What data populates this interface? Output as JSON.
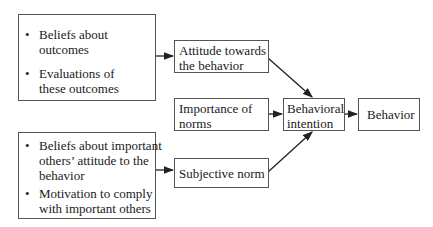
{
  "diagram": {
    "bullet_glyph": "•",
    "outcomes_box": {
      "items": [
        {
          "line1": "Beliefs about",
          "line2": "outcomes"
        },
        {
          "line1": "Evaluations of",
          "line2": "these outcomes"
        }
      ]
    },
    "norms_box": {
      "items": [
        {
          "line1": "Beliefs about important",
          "line2": "others’ attitude to the",
          "line3": "behavior"
        },
        {
          "line1": "Motivation to comply",
          "line2": "with important others"
        }
      ]
    },
    "attitude": {
      "line1": "Attitude towards",
      "line2": "the behavior"
    },
    "importance": {
      "line1": "Importance of",
      "line2": "norms"
    },
    "subjective": {
      "line1": "Subjective norm"
    },
    "intention": {
      "line1": "Behavioral",
      "line2": "intention"
    },
    "behavior": {
      "line1": "Behavior"
    }
  }
}
